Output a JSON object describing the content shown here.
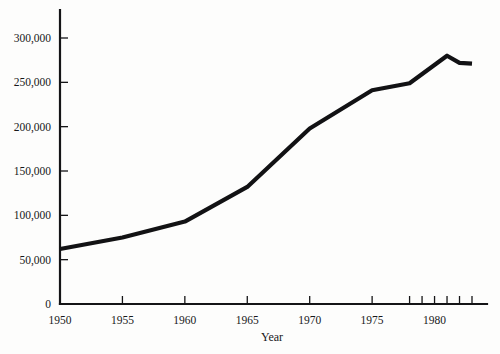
{
  "chart_data": {
    "type": "line",
    "title": "",
    "subtitle": "",
    "xlabel": "Year",
    "ylabel": "",
    "xlim": [
      1950,
      1983.5
    ],
    "ylim": [
      0,
      310000
    ],
    "grid": false,
    "legend": null,
    "x_ticks": [
      {
        "value": 1950,
        "label": "1950"
      },
      {
        "value": 1955,
        "label": "1955"
      },
      {
        "value": 1960,
        "label": "1960"
      },
      {
        "value": 1965,
        "label": "1965"
      },
      {
        "value": 1970,
        "label": "1970"
      },
      {
        "value": 1975,
        "label": "1975"
      },
      {
        "value": 1978,
        "label": ""
      },
      {
        "value": 1979,
        "label": ""
      },
      {
        "value": 1980,
        "label": "1980"
      },
      {
        "value": 1981,
        "label": ""
      },
      {
        "value": 1982,
        "label": ""
      },
      {
        "value": 1983,
        "label": ""
      }
    ],
    "y_ticks": [
      {
        "value": 0,
        "label": "0"
      },
      {
        "value": 50000,
        "label": "50,000"
      },
      {
        "value": 100000,
        "label": "100,000"
      },
      {
        "value": 150000,
        "label": "150,000"
      },
      {
        "value": 200000,
        "label": "200,000"
      },
      {
        "value": 250000,
        "label": "250,000"
      },
      {
        "value": 300000,
        "label": "300,000"
      }
    ],
    "series": [
      {
        "name": "series-1",
        "color": "#121214",
        "x": [
          1950,
          1955,
          1960,
          1965,
          1970,
          1975,
          1978,
          1981,
          1982,
          1983
        ],
        "values": [
          62000,
          75000,
          93000,
          132000,
          198000,
          241000,
          249000,
          280000,
          272000,
          271000
        ]
      }
    ]
  }
}
